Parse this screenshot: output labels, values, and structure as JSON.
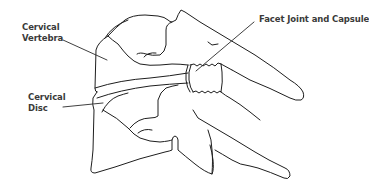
{
  "diagram": {
    "labels": [
      {
        "id": "vertebra",
        "line1": "Cervical",
        "line2": "Vertebra"
      },
      {
        "id": "disc",
        "line1": "Cervical",
        "line2": "Disc"
      },
      {
        "id": "facet",
        "line1": "Facet Joint and Capsule"
      }
    ],
    "colors": {
      "line": "#1e1e1e",
      "label_text": "#3a3a3a",
      "background": "#ffffff"
    }
  }
}
